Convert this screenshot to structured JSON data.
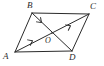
{
  "figure": {
    "type": "geometry-diagram",
    "shape": "parallelogram",
    "background_color": "#ffffff",
    "stroke_color": "#2b2b2b",
    "label_color": "#2b2b2b",
    "vertices": [
      {
        "id": "A",
        "label": "A",
        "x": 15,
        "y": 52
      },
      {
        "id": "B",
        "label": "B",
        "x": 32,
        "y": 13
      },
      {
        "id": "C",
        "label": "C",
        "x": 89,
        "y": 14
      },
      {
        "id": "D",
        "label": "D",
        "x": 72,
        "y": 51
      },
      {
        "id": "O",
        "label": "O",
        "x": 52,
        "y": 33
      }
    ],
    "sides": [
      {
        "name": "side-AB",
        "from": "A",
        "to": "B"
      },
      {
        "name": "side-BC",
        "from": "B",
        "to": "C"
      },
      {
        "name": "side-CD",
        "from": "C",
        "to": "D"
      },
      {
        "name": "side-DA",
        "from": "D",
        "to": "A"
      }
    ],
    "diagonals": [
      {
        "name": "diagonal-AC",
        "from": "A",
        "to": "C",
        "tick_marks": 2
      },
      {
        "name": "diagonal-BD",
        "from": "B",
        "to": "D",
        "tick_marks": 1
      }
    ],
    "arrow_marks": [
      {
        "name": "arrow-mark-AO",
        "on": "diagonal-AC",
        "x": 32,
        "y": 41,
        "angle": -34
      },
      {
        "name": "arrow-mark-OC",
        "on": "diagonal-AC",
        "x": 70,
        "y": 26,
        "angle": -34
      },
      {
        "name": "arrow-mark-BO",
        "on": "diagonal-BD",
        "x": 41,
        "y": 22,
        "angle": 63
      }
    ]
  }
}
